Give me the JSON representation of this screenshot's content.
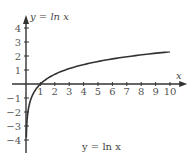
{
  "chart_data": {
    "type": "line",
    "title": "y = ln x",
    "xlabel": "x",
    "ylabel": "y = ln x",
    "caption": "y = ln x",
    "x_ticks": [
      1,
      2,
      3,
      4,
      5,
      6,
      7,
      8,
      9,
      10
    ],
    "y_ticks": [
      -4,
      -3,
      -2,
      -1,
      1,
      2,
      3,
      4
    ],
    "xlim": [
      0,
      10.5
    ],
    "ylim": [
      -4.5,
      4.5
    ],
    "grid": false,
    "series": [
      {
        "name": "y = ln x",
        "x": [
          0.03,
          0.05,
          0.1,
          0.2,
          0.3,
          0.5,
          0.75,
          1,
          1.5,
          2,
          3,
          4,
          5,
          6,
          7,
          8,
          9,
          10
        ],
        "values": [
          -3.51,
          -3.0,
          -2.3,
          -1.61,
          -1.2,
          -0.69,
          -0.29,
          0,
          0.41,
          0.69,
          1.1,
          1.39,
          1.61,
          1.79,
          1.95,
          2.08,
          2.2,
          2.3
        ]
      }
    ],
    "colors": {
      "axis": "#333333",
      "curve": "#333333",
      "text": "#555555"
    }
  }
}
